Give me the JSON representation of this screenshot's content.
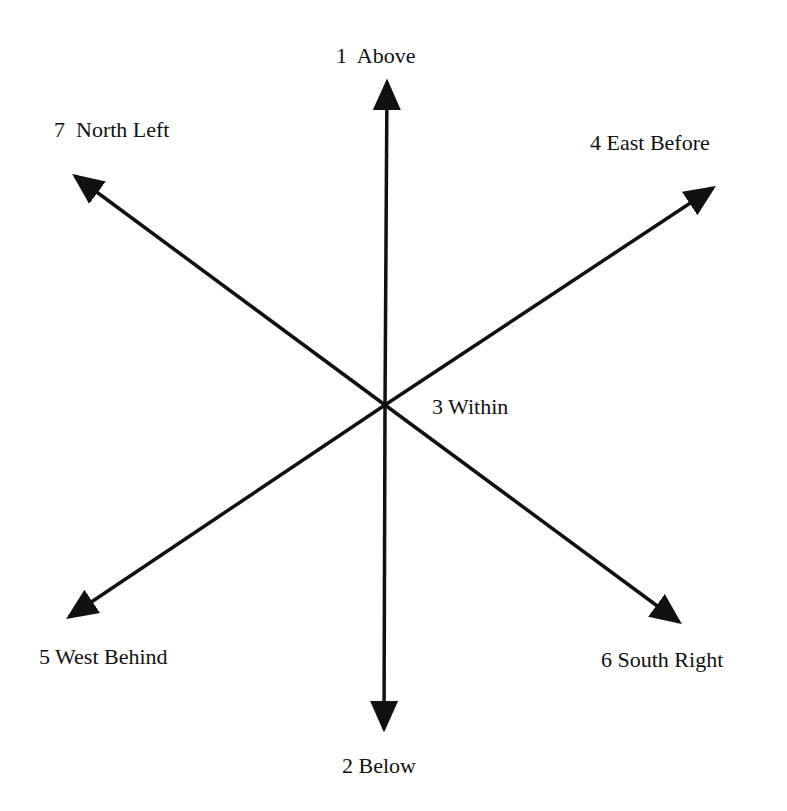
{
  "diagram": {
    "type": "directional-axes",
    "center": {
      "x": 385,
      "y": 405
    },
    "line_color": "#111111",
    "background": "#ffffff",
    "arrows": [
      {
        "id": "above",
        "x1": 385,
        "y1": 405,
        "x2": 387,
        "y2": 82
      },
      {
        "id": "below",
        "x1": 385,
        "y1": 405,
        "x2": 384,
        "y2": 729
      },
      {
        "id": "north-left",
        "x1": 385,
        "y1": 405,
        "x2": 75,
        "y2": 176
      },
      {
        "id": "east-before",
        "x1": 385,
        "y1": 405,
        "x2": 713,
        "y2": 188
      },
      {
        "id": "west-behind",
        "x1": 385,
        "y1": 405,
        "x2": 69,
        "y2": 617
      },
      {
        "id": "south-right",
        "x1": 385,
        "y1": 405,
        "x2": 679,
        "y2": 622
      }
    ],
    "labels": {
      "above": "1  Above",
      "below": "2 Below",
      "within": "3 Within",
      "east_before": "4 East Before",
      "west_behind": "5 West Behind",
      "south_right": "6 South Right",
      "north_left": "7  North Left"
    }
  }
}
